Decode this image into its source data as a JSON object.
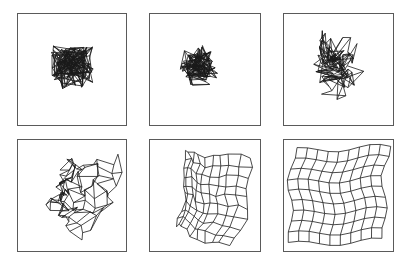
{
  "figure": {
    "grid_size": [
      10,
      10
    ],
    "line_color": "#1a1a1a",
    "border_color": "#5a5a5a",
    "panels": [
      {
        "id": "stage-1",
        "row": 0,
        "col": 0,
        "box": [
          17,
          13,
          110,
          113
        ],
        "state": "random-tangled",
        "center": [
          0.5,
          0.48
        ],
        "spread": 0.22,
        "order": 0.0,
        "seed": 11
      },
      {
        "id": "stage-2",
        "row": 0,
        "col": 1,
        "box": [
          149,
          13,
          112,
          113
        ],
        "state": "partially-ordered",
        "center": [
          0.46,
          0.46
        ],
        "spread": 0.2,
        "order": 0.25,
        "seed": 23
      },
      {
        "id": "stage-3",
        "row": 0,
        "col": 2,
        "box": [
          283,
          13,
          111,
          113
        ],
        "state": "folded",
        "center": [
          0.5,
          0.45
        ],
        "spread": 0.3,
        "order": 0.5,
        "seed": 37
      },
      {
        "id": "stage-4",
        "row": 1,
        "col": 0,
        "box": [
          17,
          139,
          110,
          113
        ],
        "state": "unfolding",
        "center": [
          0.55,
          0.5
        ],
        "spread": 0.38,
        "order": 0.72,
        "seed": 41
      },
      {
        "id": "stage-5",
        "row": 1,
        "col": 1,
        "box": [
          149,
          139,
          112,
          113
        ],
        "state": "nearly-ordered",
        "center": [
          0.5,
          0.52
        ],
        "spread": 0.4,
        "order": 0.9,
        "seed": 53
      },
      {
        "id": "stage-6",
        "row": 1,
        "col": 2,
        "box": [
          283,
          139,
          111,
          113
        ],
        "state": "ordered-grid",
        "center": [
          0.5,
          0.5
        ],
        "spread": 0.43,
        "order": 1.0,
        "seed": 67
      }
    ]
  }
}
